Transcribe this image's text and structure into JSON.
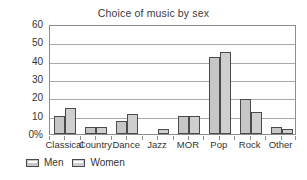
{
  "chart_data": {
    "type": "bar",
    "title": "Choice of music by sex",
    "xlabel": "",
    "ylabel": "",
    "ylim": [
      0,
      60
    ],
    "ytick_values": [
      0,
      10,
      20,
      30,
      40,
      50,
      60
    ],
    "ytick_labels": [
      "0%",
      "10",
      "20",
      "30",
      "40",
      "50",
      "60"
    ],
    "grid": true,
    "legend_position": "bottom-left",
    "categories": [
      "Classical",
      "Country",
      "Dance",
      "Jazz",
      "MOR",
      "Pop",
      "Rock",
      "Other"
    ],
    "series": [
      {
        "name": "Men",
        "color": "#c6c6c6",
        "values": [
          10,
          4,
          7,
          0,
          10,
          42,
          19,
          4
        ]
      },
      {
        "name": "Women",
        "color": "#cfcfcf",
        "values": [
          14,
          4,
          11,
          3,
          10,
          45,
          12,
          3
        ]
      }
    ]
  },
  "legend": {
    "items": [
      {
        "label": "Men"
      },
      {
        "label": "Women"
      }
    ]
  },
  "colors": {
    "bar_fill_men": "#c6c6c6",
    "bar_fill_women": "#cfcfcf",
    "bar_outline": "#4a4a4a",
    "gridline": "#a9a9a9",
    "axis": "#8d8d8d",
    "text": "#333333",
    "background": "#ffffff"
  }
}
